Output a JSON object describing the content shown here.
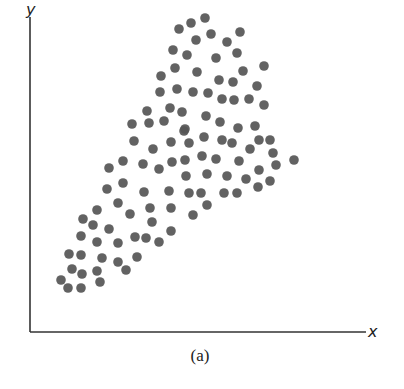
{
  "figure": {
    "caption": "(a)",
    "x_axis_label": "x",
    "y_axis_label": "y",
    "axis_color": "#333333",
    "dot_color": "#555555",
    "dot_radius": 4.8
  },
  "chart_data": {
    "type": "scatter",
    "title": "",
    "caption": "(a)",
    "xlabel": "x",
    "ylabel": "y",
    "ticks": "none",
    "grid": false,
    "legend": "none",
    "pixel_points": [
      [
        179,
        29
      ],
      [
        191,
        23
      ],
      [
        205,
        18
      ],
      [
        211,
        34
      ],
      [
        240,
        32
      ],
      [
        196,
        40
      ],
      [
        227,
        42
      ],
      [
        173,
        50
      ],
      [
        187,
        55
      ],
      [
        216,
        58
      ],
      [
        237,
        53
      ],
      [
        264,
        66
      ],
      [
        175,
        68
      ],
      [
        197,
        72
      ],
      [
        243,
        71
      ],
      [
        161,
        76
      ],
      [
        219,
        80
      ],
      [
        233,
        82
      ],
      [
        257,
        86
      ],
      [
        160,
        92
      ],
      [
        177,
        89
      ],
      [
        193,
        92
      ],
      [
        208,
        93
      ],
      [
        222,
        99
      ],
      [
        234,
        100
      ],
      [
        249,
        99
      ],
      [
        264,
        105
      ],
      [
        147,
        111
      ],
      [
        170,
        108
      ],
      [
        182,
        112
      ],
      [
        206,
        116
      ],
      [
        132,
        124
      ],
      [
        149,
        123
      ],
      [
        164,
        121
      ],
      [
        220,
        122
      ],
      [
        185,
        129
      ],
      [
        238,
        128
      ],
      [
        255,
        126
      ],
      [
        184,
        131
      ],
      [
        134,
        141
      ],
      [
        153,
        149
      ],
      [
        171,
        142
      ],
      [
        189,
        143
      ],
      [
        204,
        137
      ],
      [
        222,
        140
      ],
      [
        232,
        143
      ],
      [
        250,
        149
      ],
      [
        259,
        140
      ],
      [
        270,
        140
      ],
      [
        273,
        153
      ],
      [
        109,
        168
      ],
      [
        123,
        161
      ],
      [
        143,
        164
      ],
      [
        159,
        169
      ],
      [
        172,
        162
      ],
      [
        185,
        160
      ],
      [
        202,
        156
      ],
      [
        216,
        159
      ],
      [
        239,
        161
      ],
      [
        276,
        165
      ],
      [
        294,
        160
      ],
      [
        186,
        176
      ],
      [
        207,
        174
      ],
      [
        227,
        176
      ],
      [
        246,
        179
      ],
      [
        259,
        170
      ],
      [
        270,
        181
      ],
      [
        258,
        187
      ],
      [
        107,
        189
      ],
      [
        123,
        183
      ],
      [
        144,
        192
      ],
      [
        169,
        191
      ],
      [
        189,
        193
      ],
      [
        201,
        193
      ],
      [
        224,
        193
      ],
      [
        237,
        193
      ],
      [
        118,
        203
      ],
      [
        97,
        210
      ],
      [
        130,
        214
      ],
      [
        150,
        208
      ],
      [
        171,
        208
      ],
      [
        193,
        215
      ],
      [
        207,
        205
      ],
      [
        83,
        219
      ],
      [
        93,
        225
      ],
      [
        109,
        229
      ],
      [
        152,
        222
      ],
      [
        171,
        231
      ],
      [
        81,
        236
      ],
      [
        97,
        242
      ],
      [
        118,
        243
      ],
      [
        135,
        237
      ],
      [
        146,
        238
      ],
      [
        159,
        242
      ],
      [
        69,
        254
      ],
      [
        81,
        255
      ],
      [
        102,
        258
      ],
      [
        118,
        262
      ],
      [
        137,
        257
      ],
      [
        72,
        269
      ],
      [
        82,
        274
      ],
      [
        97,
        271
      ],
      [
        126,
        270
      ],
      [
        61,
        280
      ],
      [
        68,
        288
      ],
      [
        81,
        288
      ],
      [
        100,
        282
      ]
    ],
    "axes_pixel": {
      "origin": [
        30,
        332
      ],
      "x_end": 366,
      "y_top": 17
    }
  }
}
